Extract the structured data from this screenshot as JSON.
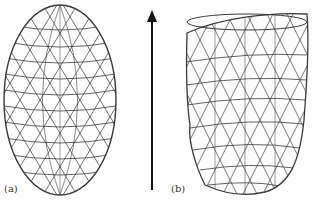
{
  "figure": {
    "panels": [
      {
        "id": "a",
        "label": "(a)",
        "shape": "ellipsoid-wireframe",
        "description": "Regular ellipsoidal triangulated mesh"
      },
      {
        "id": "b",
        "label": "(b)",
        "shape": "deformed-wireframe",
        "description": "Deformed truncated mesh (heart-ventricle-like)"
      }
    ],
    "arrow": {
      "direction": "up",
      "icon": "arrow-up-icon"
    },
    "colors": {
      "mesh": "#3a3a3a",
      "arrow": "#111111",
      "background": "#ffffff"
    }
  }
}
